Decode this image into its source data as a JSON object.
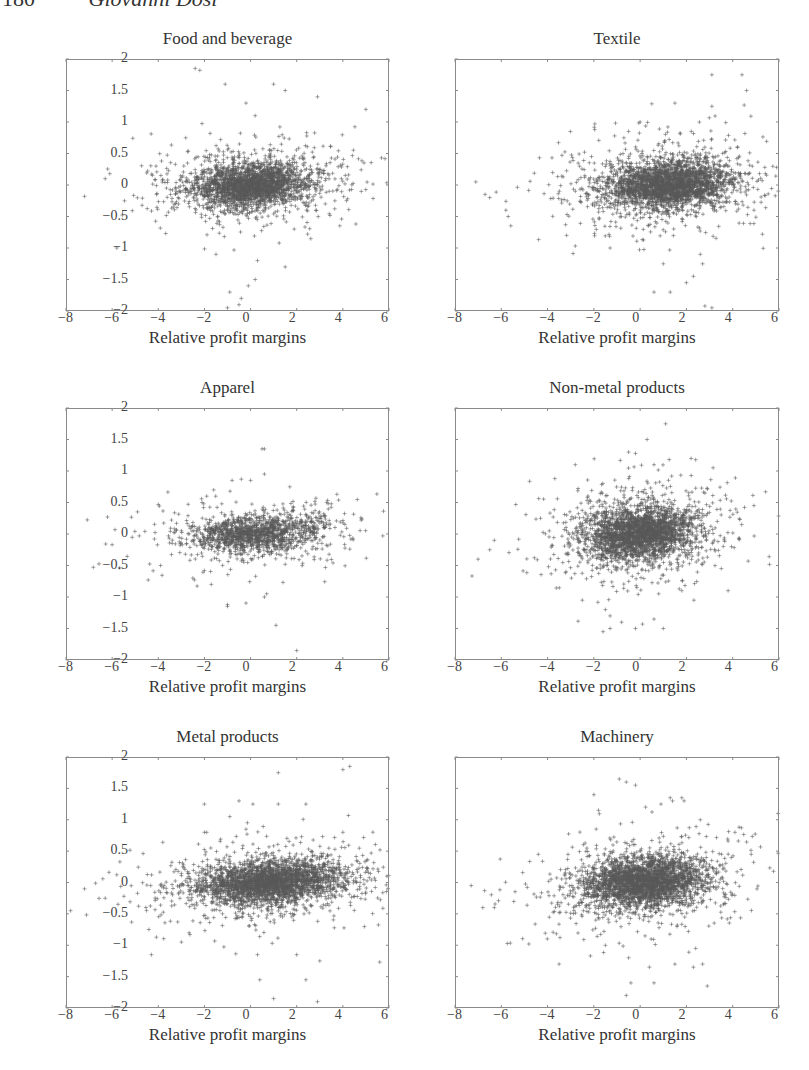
{
  "page": {
    "number": "180",
    "author": "Giovanni Dosi"
  },
  "figure": {
    "xlabel": "Relative profit margins",
    "x_ticks": [
      "−8",
      "−6",
      "−4",
      "−2",
      "0",
      "2",
      "4",
      "6"
    ],
    "y_ticks": [
      "2",
      "1.5",
      "1",
      "0.5",
      "0",
      "−0.5",
      "−1",
      "−1.5",
      "−2"
    ],
    "marker_color": "#5a5a5a",
    "axis_color": "#8a8a8a"
  },
  "chart_data": [
    {
      "type": "scatter",
      "title": "Food and beverage",
      "xlabel": "Relative profit margins",
      "ylabel": "",
      "xlim": [
        -8,
        6
      ],
      "ylim": [
        -2,
        2
      ],
      "x_ticks": [
        -8,
        -6,
        -4,
        -2,
        0,
        2,
        4,
        6
      ],
      "y_ticks": [
        -2,
        -1.5,
        -1,
        -0.5,
        0,
        0.5,
        1,
        1.5,
        2
      ],
      "marker": "+",
      "grid": false,
      "cluster": {
        "cx": 0.0,
        "cy": 0.0,
        "sx": 1.5,
        "sy": 0.2,
        "n": 2600,
        "seed": 11
      },
      "outliers": [
        [
          -2.4,
          1.85
        ],
        [
          -2.2,
          1.82
        ],
        [
          -1.1,
          1.6
        ],
        [
          1.0,
          1.6
        ],
        [
          1.5,
          1.5
        ],
        [
          2.9,
          1.4
        ],
        [
          5.0,
          1.2
        ],
        [
          -0.2,
          1.3
        ],
        [
          0.2,
          1.1
        ],
        [
          -1.3,
          0.72
        ],
        [
          -6.3,
          0.1
        ],
        [
          -6.1,
          0.18
        ],
        [
          -7.2,
          -0.18
        ],
        [
          -5.8,
          -1.0
        ],
        [
          -0.9,
          -1.7
        ],
        [
          -0.4,
          -1.8
        ],
        [
          -0.1,
          -1.6
        ],
        [
          0.2,
          -1.5
        ],
        [
          -1.0,
          -1.95
        ],
        [
          -0.5,
          -1.9
        ],
        [
          1.5,
          -1.3
        ],
        [
          0.3,
          -1.2
        ],
        [
          -1.5,
          -1.1
        ]
      ]
    },
    {
      "type": "scatter",
      "title": "Textile",
      "xlabel": "Relative profit margins",
      "ylabel": "",
      "xlim": [
        -8,
        6
      ],
      "ylim": [
        -2,
        2
      ],
      "x_ticks": [
        -8,
        -6,
        -4,
        -2,
        0,
        2,
        4,
        6
      ],
      "y_ticks": [
        -2,
        -1.5,
        -1,
        -0.5,
        0,
        0.5,
        1,
        1.5,
        2
      ],
      "marker": "+",
      "grid": false,
      "cluster": {
        "cx": 1.2,
        "cy": 0.0,
        "sx": 1.6,
        "sy": 0.22,
        "n": 3000,
        "seed": 23
      },
      "outliers": [
        [
          3.1,
          1.75
        ],
        [
          4.4,
          1.75
        ],
        [
          4.6,
          1.5
        ],
        [
          1.5,
          1.3
        ],
        [
          3.1,
          1.25
        ],
        [
          0.0,
          1.0
        ],
        [
          -0.5,
          0.85
        ],
        [
          -0.7,
          0.75
        ],
        [
          1.2,
          0.92
        ],
        [
          2.8,
          0.6
        ],
        [
          4.2,
          0.6
        ],
        [
          -2.1,
          0.45
        ],
        [
          -7.1,
          0.05
        ],
        [
          -6.7,
          -0.15
        ],
        [
          -6.5,
          -0.2
        ],
        [
          -5.8,
          -0.4
        ],
        [
          -5.7,
          -0.5
        ],
        [
          1.0,
          -1.25
        ],
        [
          2.6,
          -1.1
        ],
        [
          2.7,
          -1.25
        ],
        [
          2.3,
          -1.45
        ],
        [
          2.0,
          -1.55
        ],
        [
          0.6,
          -1.7
        ],
        [
          1.3,
          -1.7
        ],
        [
          2.8,
          -1.92
        ],
        [
          3.1,
          -1.95
        ],
        [
          -1.3,
          -1.0
        ]
      ]
    },
    {
      "type": "scatter",
      "title": "Apparel",
      "xlabel": "Relative profit margins",
      "ylabel": "",
      "xlim": [
        -8,
        6
      ],
      "ylim": [
        -2,
        2
      ],
      "x_ticks": [
        -8,
        -6,
        -4,
        -2,
        0,
        2,
        4,
        6
      ],
      "y_ticks": [
        -2,
        -1.5,
        -1,
        -0.5,
        0,
        0.5,
        1,
        1.5,
        2
      ],
      "marker": "+",
      "grid": false,
      "cluster": {
        "cx": 0.2,
        "cy": 0.0,
        "sx": 1.7,
        "sy": 0.17,
        "n": 1500,
        "seed": 37
      },
      "outliers": [
        [
          0.5,
          1.35
        ],
        [
          0.6,
          1.35
        ],
        [
          0.6,
          0.95
        ],
        [
          -0.8,
          0.85
        ],
        [
          -0.4,
          0.87
        ],
        [
          0.0,
          0.85
        ],
        [
          1.7,
          0.75
        ],
        [
          -1.6,
          0.7
        ],
        [
          -1.9,
          0.6
        ],
        [
          -2.1,
          0.5
        ],
        [
          3.3,
          0.5
        ],
        [
          3.5,
          0.48
        ],
        [
          -6.2,
          0.27
        ],
        [
          -6.0,
          -0.17
        ],
        [
          -4.9,
          0.35
        ],
        [
          -1.7,
          -0.8
        ],
        [
          -1.0,
          -1.15
        ],
        [
          -1.0,
          -1.12
        ],
        [
          0.6,
          -1.0
        ],
        [
          0.7,
          -0.95
        ],
        [
          1.1,
          -1.45
        ],
        [
          2.0,
          -1.85
        ],
        [
          -3.9,
          -0.5
        ],
        [
          -2.5,
          -0.7
        ]
      ]
    },
    {
      "type": "scatter",
      "title": "Non-metal products",
      "xlabel": "Relative profit margins",
      "ylabel": "",
      "xlim": [
        -8,
        6
      ],
      "ylim": [
        -2,
        2
      ],
      "x_ticks": [
        -8,
        -6,
        -4,
        -2,
        0,
        2,
        4,
        6
      ],
      "y_ticks": [
        -2,
        -1.5,
        -1,
        -0.5,
        0,
        0.5,
        1,
        1.5,
        2
      ],
      "marker": "+",
      "grid": false,
      "cluster": {
        "cx": 0.0,
        "cy": 0.0,
        "sx": 1.4,
        "sy": 0.25,
        "n": 2800,
        "seed": 51
      },
      "outliers": [
        [
          1.1,
          1.75
        ],
        [
          0.3,
          1.5
        ],
        [
          -0.5,
          1.3
        ],
        [
          -0.2,
          1.28
        ],
        [
          2.2,
          1.2
        ],
        [
          2.4,
          1.18
        ],
        [
          0.6,
          1.1
        ],
        [
          -2.8,
          1.1
        ],
        [
          2.8,
          0.65
        ],
        [
          -7.0,
          -0.4
        ],
        [
          -6.5,
          -0.25
        ],
        [
          -6.3,
          -0.1
        ],
        [
          -2.5,
          -1.05
        ],
        [
          -1.5,
          -1.2
        ],
        [
          -1.3,
          -1.3
        ],
        [
          -1.6,
          -1.55
        ],
        [
          -1.3,
          -1.5
        ],
        [
          -0.2,
          -1.5
        ],
        [
          1.0,
          -1.5
        ],
        [
          -0.8,
          -1.4
        ],
        [
          0.6,
          -1.35
        ],
        [
          3.8,
          -0.9
        ],
        [
          0.8,
          -0.95
        ],
        [
          1.8,
          -0.9
        ],
        [
          -3.2,
          -0.6
        ]
      ]
    },
    {
      "type": "scatter",
      "title": "Metal products",
      "xlabel": "Relative profit margins",
      "ylabel": "",
      "xlim": [
        -8,
        6
      ],
      "ylim": [
        -2,
        2
      ],
      "x_ticks": [
        -8,
        -6,
        -4,
        -2,
        0,
        2,
        4,
        6
      ],
      "y_ticks": [
        -2,
        -1.5,
        -1,
        -0.5,
        0,
        0.5,
        1,
        1.5,
        2
      ],
      "marker": "+",
      "grid": false,
      "cluster": {
        "cx": 0.8,
        "cy": 0.0,
        "sx": 1.9,
        "sy": 0.2,
        "n": 3000,
        "seed": 67
      },
      "outliers": [
        [
          1.2,
          1.75
        ],
        [
          4.0,
          1.8
        ],
        [
          4.3,
          1.85
        ],
        [
          -2.0,
          1.25
        ],
        [
          -0.5,
          1.3
        ],
        [
          0.1,
          1.25
        ],
        [
          -0.9,
          1.05
        ],
        [
          1.2,
          1.25
        ],
        [
          2.4,
          1.25
        ],
        [
          4.0,
          0.8
        ],
        [
          -2.0,
          0.8
        ],
        [
          -1.9,
          0.8
        ],
        [
          -0.2,
          0.85
        ],
        [
          -7.2,
          -0.1
        ],
        [
          -7.8,
          -0.45
        ],
        [
          -6.3,
          -0.25
        ],
        [
          -4.3,
          -1.15
        ],
        [
          -3.0,
          -0.95
        ],
        [
          0.3,
          -1.15
        ],
        [
          2.0,
          -1.15
        ],
        [
          3.0,
          -1.25
        ],
        [
          0.4,
          -1.55
        ],
        [
          2.4,
          -1.55
        ],
        [
          1.0,
          -1.85
        ],
        [
          2.9,
          -1.9
        ]
      ]
    },
    {
      "type": "scatter",
      "title": "Machinery",
      "xlabel": "Relative profit margins",
      "ylabel": "",
      "xlim": [
        -8,
        6
      ],
      "ylim": [
        -2,
        2
      ],
      "x_ticks": [
        -8,
        -6,
        -4,
        -2,
        0,
        2,
        4,
        6
      ],
      "y_ticks": [
        -2,
        -1.5,
        -1,
        -0.5,
        0,
        0.5,
        1,
        1.5,
        2
      ],
      "marker": "+",
      "grid": false,
      "cluster": {
        "cx": 0.2,
        "cy": 0.0,
        "sx": 1.5,
        "sy": 0.23,
        "n": 3000,
        "seed": 83
      },
      "outliers": [
        [
          -0.9,
          1.65
        ],
        [
          -0.6,
          1.6
        ],
        [
          -0.2,
          1.55
        ],
        [
          -2.0,
          1.4
        ],
        [
          1.3,
          1.35
        ],
        [
          1.4,
          1.3
        ],
        [
          0.9,
          1.25
        ],
        [
          1.8,
          1.35
        ],
        [
          1.9,
          1.3
        ],
        [
          2.6,
          1.0
        ],
        [
          4.1,
          0.8
        ],
        [
          4.8,
          0.45
        ],
        [
          -4.4,
          0.45
        ],
        [
          -1.8,
          1.15
        ],
        [
          -7.3,
          -0.05
        ],
        [
          -6.8,
          -0.4
        ],
        [
          -6.3,
          -0.4
        ],
        [
          -3.5,
          -1.3
        ],
        [
          -1.5,
          -1.0
        ],
        [
          -0.5,
          -1.2
        ],
        [
          0.4,
          -1.35
        ],
        [
          1.5,
          -1.3
        ],
        [
          2.7,
          -1.3
        ],
        [
          -0.4,
          -1.6
        ],
        [
          0.6,
          -1.6
        ],
        [
          -0.6,
          -1.8
        ],
        [
          2.9,
          -1.65
        ],
        [
          2.4,
          -1.05
        ],
        [
          2.3,
          -1.35
        ]
      ]
    }
  ],
  "panels_layout": [
    {
      "left": 66,
      "top": 59,
      "width": 323,
      "height": 252
    },
    {
      "left": 455,
      "top": 59,
      "width": 324,
      "height": 252
    },
    {
      "left": 66,
      "top": 408,
      "width": 323,
      "height": 252
    },
    {
      "left": 455,
      "top": 408,
      "width": 324,
      "height": 252
    },
    {
      "left": 66,
      "top": 757,
      "width": 323,
      "height": 251
    },
    {
      "left": 455,
      "top": 757,
      "width": 324,
      "height": 251
    }
  ]
}
